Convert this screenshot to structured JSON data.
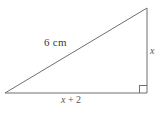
{
  "figure": {
    "shape": "right-triangle",
    "background_color": "#ffffff",
    "line_color": "#6f6f70",
    "text_color": "#3a3a3c",
    "vertices": {
      "left": [
        5,
        93
      ],
      "top_right": [
        147,
        8
      ],
      "bottom_right": [
        147,
        93
      ]
    },
    "right_angle_at": "bottom-right",
    "right_angle_marker_size": 8,
    "labels": {
      "hypotenuse": "6 cm",
      "vertical_leg": "x",
      "base_variable": "x",
      "base_operator": "+",
      "base_constant": "2",
      "base_full": "x + 2"
    }
  }
}
